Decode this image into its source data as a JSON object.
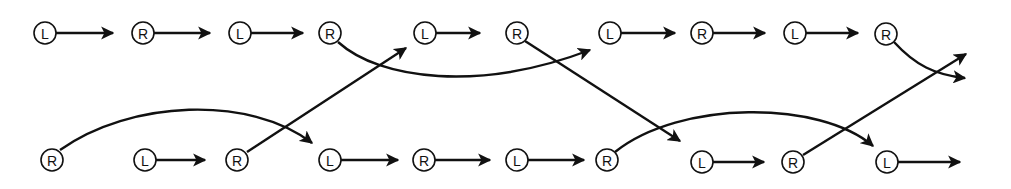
{
  "diagram": {
    "title": "",
    "colors": {
      "stroke": "#111111",
      "background": "#ffffff"
    },
    "node_radius": 11,
    "nodes": [
      {
        "id": "t1",
        "label": "L",
        "row": "top",
        "x": 45,
        "y": 33
      },
      {
        "id": "t2",
        "label": "R",
        "row": "top",
        "x": 143,
        "y": 33
      },
      {
        "id": "t3",
        "label": "L",
        "row": "top",
        "x": 240,
        "y": 33
      },
      {
        "id": "t4",
        "label": "R",
        "row": "top",
        "x": 330,
        "y": 33
      },
      {
        "id": "t5",
        "label": "L",
        "row": "top",
        "x": 425,
        "y": 33
      },
      {
        "id": "t6",
        "label": "R",
        "row": "top",
        "x": 517,
        "y": 33
      },
      {
        "id": "t7",
        "label": "L",
        "row": "top",
        "x": 610,
        "y": 33
      },
      {
        "id": "t8",
        "label": "R",
        "row": "top",
        "x": 702,
        "y": 33
      },
      {
        "id": "t9",
        "label": "L",
        "row": "top",
        "x": 795,
        "y": 33
      },
      {
        "id": "t10",
        "label": "R",
        "row": "top",
        "x": 886,
        "y": 34
      },
      {
        "id": "b1",
        "label": "R",
        "row": "bottom",
        "x": 52,
        "y": 160
      },
      {
        "id": "b2",
        "label": "L",
        "row": "bottom",
        "x": 145,
        "y": 160
      },
      {
        "id": "b3",
        "label": "R",
        "row": "bottom",
        "x": 237,
        "y": 160
      },
      {
        "id": "b4",
        "label": "L",
        "row": "bottom",
        "x": 330,
        "y": 160
      },
      {
        "id": "b5",
        "label": "R",
        "row": "bottom",
        "x": 424,
        "y": 160
      },
      {
        "id": "b6",
        "label": "L",
        "row": "bottom",
        "x": 517,
        "y": 160
      },
      {
        "id": "b7",
        "label": "R",
        "row": "bottom",
        "x": 607,
        "y": 160
      },
      {
        "id": "b8",
        "label": "L",
        "row": "bottom",
        "x": 702,
        "y": 162
      },
      {
        "id": "b9",
        "label": "R",
        "row": "bottom",
        "x": 793,
        "y": 162
      },
      {
        "id": "b10",
        "label": "L",
        "row": "bottom",
        "x": 887,
        "y": 162
      }
    ],
    "edges": [
      {
        "from": "t1",
        "to": "t2",
        "path": "M56,33 L113,33"
      },
      {
        "from": "t2",
        "to": "t3",
        "path": "M154,33 L210,33"
      },
      {
        "from": "t3",
        "to": "t4",
        "path": "M251,33 L303,33"
      },
      {
        "from": "t4",
        "to": "t7",
        "path": "M338,42 C 380,80 480,92 590,50"
      },
      {
        "from": "t5",
        "to": "t6",
        "path": "M436,33 L480,33"
      },
      {
        "from": "t6",
        "to": "b8",
        "path": "M525,41 L680,141"
      },
      {
        "from": "t7",
        "to": "t8",
        "path": "M621,33 L675,33"
      },
      {
        "from": "t8",
        "to": "t9",
        "path": "M713,33 L765,33"
      },
      {
        "from": "t9",
        "to": "t10",
        "path": "M806,33 L858,33"
      },
      {
        "from": "t10",
        "to": "exit-right-lower",
        "path": "M894,42 C 915,65 935,75 965,78"
      },
      {
        "from": "b1",
        "to": "b4",
        "path": "M60,150 C 130,100 250,95 312,143"
      },
      {
        "from": "b2",
        "to": "b3",
        "path": "M156,160 L205,160"
      },
      {
        "from": "b3",
        "to": "t5",
        "path": "M247,152 L406,48"
      },
      {
        "from": "b4",
        "to": "b5",
        "path": "M341,160 L398,160"
      },
      {
        "from": "b5",
        "to": "b6",
        "path": "M435,160 L490,160"
      },
      {
        "from": "b6",
        "to": "b7",
        "path": "M528,160 L584,160"
      },
      {
        "from": "b7",
        "to": "b10",
        "path": "M615,152 C 680,100 820,100 873,146"
      },
      {
        "from": "b8",
        "to": "b9",
        "path": "M713,162 L764,162"
      },
      {
        "from": "b9",
        "to": "exit-right-upper",
        "path": "M803,155 L966,54"
      },
      {
        "from": "b10",
        "to": "exit-right",
        "path": "M898,162 L960,162"
      }
    ]
  }
}
